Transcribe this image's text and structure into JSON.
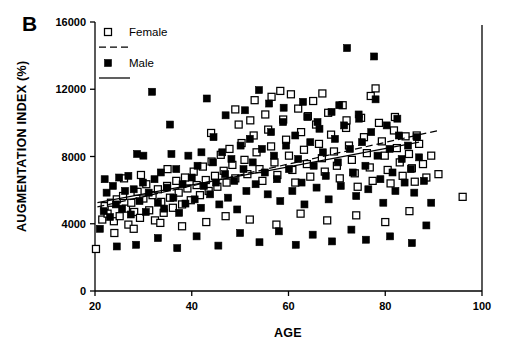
{
  "chart_data": {
    "type": "scatter",
    "title": "",
    "panel_label": "B",
    "xlabel": "AGE",
    "ylabel": "AUGMENTATION INDEX (%)",
    "xlim": [
      20,
      100
    ],
    "ylim": [
      0,
      16000
    ],
    "xticks": [
      20,
      40,
      60,
      80,
      100
    ],
    "yticks": [
      0,
      4000,
      8000,
      12000,
      16000
    ],
    "xtick_labels": [
      "20",
      "40",
      "60",
      "80",
      "100"
    ],
    "ytick_labels": [
      "0",
      "4000",
      "8000",
      "12000",
      "16000"
    ],
    "grid": false,
    "legend_position": "top-left-inside",
    "legend": [
      {
        "label": "Female",
        "marker": "open-square",
        "line": "dashed"
      },
      {
        "label": "Male",
        "marker": "filled-square",
        "line": "solid"
      }
    ],
    "series": [
      {
        "name": "Female",
        "marker": "open-square",
        "fit_line": {
          "style": "dashed",
          "x": [
            20.5,
            91.0
          ],
          "y": [
            5000,
            9550
          ]
        },
        "points": [
          [
            20.2,
            2500
          ],
          [
            21.5,
            4250
          ],
          [
            22.0,
            5050
          ],
          [
            22.6,
            4600
          ],
          [
            23.3,
            5250
          ],
          [
            23.9,
            4150
          ],
          [
            24.5,
            5450
          ],
          [
            25.1,
            4450
          ],
          [
            25.8,
            5650
          ],
          [
            26.4,
            4900
          ],
          [
            26.9,
            3950
          ],
          [
            27.5,
            5250
          ],
          [
            28.1,
            4700
          ],
          [
            28.8,
            5900
          ],
          [
            29.3,
            4350
          ],
          [
            30.0,
            5500
          ],
          [
            30.6,
            6350
          ],
          [
            31.2,
            4800
          ],
          [
            31.9,
            5700
          ],
          [
            32.4,
            4200
          ],
          [
            33.0,
            6050
          ],
          [
            33.7,
            5300
          ],
          [
            34.2,
            4650
          ],
          [
            34.9,
            6250
          ],
          [
            35.5,
            5550
          ],
          [
            36.1,
            4950
          ],
          [
            36.8,
            6550
          ],
          [
            37.3,
            5850
          ],
          [
            38.0,
            5150
          ],
          [
            38.6,
            6750
          ],
          [
            39.1,
            6100
          ],
          [
            39.8,
            5400
          ],
          [
            40.4,
            7100
          ],
          [
            41.0,
            6300
          ],
          [
            41.7,
            5700
          ],
          [
            42.3,
            7400
          ],
          [
            42.9,
            6600
          ],
          [
            43.5,
            5950
          ],
          [
            44.1,
            7700
          ],
          [
            44.8,
            6850
          ],
          [
            45.3,
            6200
          ],
          [
            46.0,
            8100
          ],
          [
            46.6,
            7150
          ],
          [
            47.2,
            6450
          ],
          [
            47.8,
            8450
          ],
          [
            48.4,
            7500
          ],
          [
            49.0,
            6700
          ],
          [
            49.7,
            9900
          ],
          [
            50.3,
            8800
          ],
          [
            50.9,
            7800
          ],
          [
            51.5,
            6950
          ],
          [
            52.1,
            10150
          ],
          [
            52.8,
            9250
          ],
          [
            53.4,
            8250
          ],
          [
            54.0,
            7250
          ],
          [
            54.6,
            6550
          ],
          [
            55.2,
            10500
          ],
          [
            55.8,
            9600
          ],
          [
            56.4,
            8600
          ],
          [
            57.1,
            7650
          ],
          [
            57.7,
            6900
          ],
          [
            58.3,
            11900
          ],
          [
            58.9,
            10200
          ],
          [
            59.5,
            9000
          ],
          [
            60.1,
            8050
          ],
          [
            60.8,
            7200
          ],
          [
            61.4,
            6450
          ],
          [
            62.0,
            10850
          ],
          [
            62.6,
            9450
          ],
          [
            63.2,
            8400
          ],
          [
            63.8,
            7550
          ],
          [
            64.5,
            6800
          ],
          [
            65.1,
            11300
          ],
          [
            65.7,
            9900
          ],
          [
            66.3,
            8750
          ],
          [
            66.9,
            7900
          ],
          [
            67.5,
            7100
          ],
          [
            68.2,
            10600
          ],
          [
            68.8,
            9300
          ],
          [
            69.4,
            8300
          ],
          [
            70.0,
            7450
          ],
          [
            70.6,
            6700
          ],
          [
            71.2,
            11050
          ],
          [
            71.9,
            9700
          ],
          [
            72.5,
            8650
          ],
          [
            73.1,
            7800
          ],
          [
            73.7,
            7000
          ],
          [
            74.3,
            6200
          ],
          [
            75.0,
            10300
          ],
          [
            75.6,
            9150
          ],
          [
            76.2,
            8200
          ],
          [
            76.8,
            7350
          ],
          [
            77.4,
            6550
          ],
          [
            78.0,
            12050
          ],
          [
            78.7,
            10000
          ],
          [
            79.3,
            8900
          ],
          [
            79.9,
            8050
          ],
          [
            80.5,
            7200
          ],
          [
            81.1,
            6400
          ],
          [
            81.8,
            9550
          ],
          [
            82.4,
            8500
          ],
          [
            83.0,
            7650
          ],
          [
            83.6,
            6850
          ],
          [
            84.2,
            9200
          ],
          [
            84.9,
            8150
          ],
          [
            85.5,
            7300
          ],
          [
            86.1,
            6500
          ],
          [
            87.0,
            8750
          ],
          [
            87.8,
            7550
          ],
          [
            88.5,
            6750
          ],
          [
            89.5,
            8050
          ],
          [
            91.0,
            6950
          ],
          [
            96.0,
            5600
          ],
          [
            26.0,
            6700
          ],
          [
            29.5,
            6900
          ],
          [
            35.0,
            7250
          ],
          [
            44.0,
            9400
          ],
          [
            49.0,
            10800
          ],
          [
            53.0,
            11350
          ],
          [
            56.5,
            11550
          ],
          [
            60.5,
            11700
          ],
          [
            64.0,
            10400
          ],
          [
            67.0,
            11750
          ],
          [
            72.0,
            10150
          ],
          [
            77.0,
            11600
          ],
          [
            82.0,
            10350
          ],
          [
            86.5,
            9250
          ],
          [
            43.0,
            4100
          ],
          [
            47.0,
            4450
          ],
          [
            52.0,
            4250
          ],
          [
            57.5,
            3950
          ],
          [
            62.5,
            4600
          ],
          [
            68.0,
            4200
          ],
          [
            74.0,
            4500
          ],
          [
            80.0,
            4100
          ],
          [
            85.0,
            4750
          ],
          [
            38.0,
            3850
          ],
          [
            33.5,
            4050
          ],
          [
            28.0,
            3700
          ],
          [
            24.0,
            3450
          ]
        ]
      },
      {
        "name": "Male",
        "marker": "filled-square",
        "fit_line": {
          "style": "solid",
          "x": [
            20.5,
            87.0
          ],
          "y": [
            5250,
            8850
          ]
        },
        "points": [
          [
            21.0,
            3700
          ],
          [
            21.8,
            4750
          ],
          [
            22.4,
            5850
          ],
          [
            23.1,
            4400
          ],
          [
            23.7,
            6250
          ],
          [
            24.3,
            5150
          ],
          [
            25.0,
            6750
          ],
          [
            25.6,
            4900
          ],
          [
            26.2,
            5950
          ],
          [
            26.9,
            6850
          ],
          [
            27.4,
            4550
          ],
          [
            28.0,
            6050
          ],
          [
            28.7,
            8150
          ],
          [
            29.2,
            5350
          ],
          [
            29.9,
            6450
          ],
          [
            30.5,
            4700
          ],
          [
            31.1,
            5850
          ],
          [
            31.8,
            11850
          ],
          [
            32.3,
            6650
          ],
          [
            33.0,
            5250
          ],
          [
            33.6,
            7050
          ],
          [
            34.3,
            4900
          ],
          [
            34.9,
            6150
          ],
          [
            35.5,
            9900
          ],
          [
            36.2,
            5550
          ],
          [
            36.8,
            7250
          ],
          [
            37.4,
            4650
          ],
          [
            38.1,
            6350
          ],
          [
            38.7,
            5200
          ],
          [
            39.3,
            8050
          ],
          [
            40.0,
            6750
          ],
          [
            40.6,
            5450
          ],
          [
            41.2,
            7450
          ],
          [
            41.9,
            4950
          ],
          [
            42.5,
            6250
          ],
          [
            43.1,
            11450
          ],
          [
            43.8,
            5750
          ],
          [
            44.4,
            7650
          ],
          [
            45.0,
            6450
          ],
          [
            45.7,
            5150
          ],
          [
            46.3,
            8250
          ],
          [
            46.9,
            6950
          ],
          [
            47.5,
            5550
          ],
          [
            48.2,
            7850
          ],
          [
            48.8,
            6550
          ],
          [
            49.4,
            4850
          ],
          [
            50.1,
            8650
          ],
          [
            50.7,
            7250
          ],
          [
            51.3,
            5950
          ],
          [
            52.0,
            9050
          ],
          [
            52.6,
            7650
          ],
          [
            53.2,
            6350
          ],
          [
            53.9,
            11950
          ],
          [
            54.5,
            8450
          ],
          [
            55.1,
            7050
          ],
          [
            55.7,
            5750
          ],
          [
            56.4,
            9450
          ],
          [
            57.0,
            8050
          ],
          [
            57.6,
            6650
          ],
          [
            58.3,
            5350
          ],
          [
            58.9,
            10050
          ],
          [
            59.5,
            8650
          ],
          [
            60.1,
            7250
          ],
          [
            60.8,
            5950
          ],
          [
            61.4,
            9250
          ],
          [
            62.0,
            7850
          ],
          [
            62.7,
            6450
          ],
          [
            63.3,
            5150
          ],
          [
            63.9,
            10350
          ],
          [
            64.5,
            8850
          ],
          [
            65.2,
            7450
          ],
          [
            65.8,
            6150
          ],
          [
            66.4,
            9650
          ],
          [
            67.1,
            8250
          ],
          [
            67.7,
            6850
          ],
          [
            68.3,
            5450
          ],
          [
            68.9,
            10650
          ],
          [
            69.6,
            9050
          ],
          [
            70.2,
            7650
          ],
          [
            70.8,
            6250
          ],
          [
            71.5,
            9850
          ],
          [
            72.1,
            14450
          ],
          [
            72.7,
            8450
          ],
          [
            73.3,
            7050
          ],
          [
            74.0,
            5650
          ],
          [
            74.6,
            10250
          ],
          [
            75.2,
            8850
          ],
          [
            75.9,
            7450
          ],
          [
            76.5,
            6050
          ],
          [
            77.1,
            9450
          ],
          [
            77.7,
            13950
          ],
          [
            78.4,
            8050
          ],
          [
            79.0,
            6650
          ],
          [
            79.6,
            5250
          ],
          [
            80.3,
            9850
          ],
          [
            80.9,
            8450
          ],
          [
            81.5,
            7050
          ],
          [
            82.1,
            5950
          ],
          [
            82.8,
            9250
          ],
          [
            83.4,
            7850
          ],
          [
            84.0,
            6450
          ],
          [
            84.7,
            8650
          ],
          [
            85.3,
            7250
          ],
          [
            86.0,
            5850
          ],
          [
            87.0,
            7950
          ],
          [
            88.0,
            6550
          ],
          [
            89.5,
            5250
          ],
          [
            24.5,
            2650
          ],
          [
            28.5,
            2750
          ],
          [
            33.0,
            3150
          ],
          [
            37.0,
            2550
          ],
          [
            41.0,
            3250
          ],
          [
            45.5,
            2700
          ],
          [
            50.0,
            3450
          ],
          [
            54.0,
            2900
          ],
          [
            58.0,
            3550
          ],
          [
            61.5,
            2750
          ],
          [
            65.0,
            3350
          ],
          [
            69.0,
            2950
          ],
          [
            73.0,
            3650
          ],
          [
            76.0,
            3050
          ],
          [
            81.0,
            3250
          ],
          [
            85.5,
            2850
          ],
          [
            88.5,
            3900
          ],
          [
            22.0,
            6650
          ],
          [
            44.5,
            9150
          ],
          [
            47.0,
            10450
          ],
          [
            51.0,
            10750
          ],
          [
            56.0,
            11150
          ],
          [
            59.0,
            10900
          ],
          [
            63.0,
            11250
          ],
          [
            66.0,
            10050
          ],
          [
            70.5,
            11050
          ],
          [
            74.5,
            10500
          ],
          [
            78.0,
            11400
          ],
          [
            82.5,
            10250
          ],
          [
            86.5,
            9150
          ],
          [
            30.0,
            8050
          ],
          [
            35.8,
            8150
          ],
          [
            42.0,
            8250
          ]
        ]
      }
    ]
  }
}
